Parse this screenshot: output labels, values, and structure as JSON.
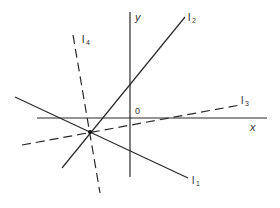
{
  "diagram": {
    "axes": {
      "x_label": "x",
      "y_label": "y",
      "origin_label": "0"
    },
    "lines": [
      {
        "id": "l1",
        "label": "l",
        "subscript": "1",
        "style": "solid"
      },
      {
        "id": "l2",
        "label": "l",
        "subscript": "2",
        "style": "solid"
      },
      {
        "id": "l3",
        "label": "l",
        "subscript": "3",
        "style": "dashed"
      },
      {
        "id": "l4",
        "label": "l",
        "subscript": "4",
        "style": "dashed"
      }
    ],
    "intersection_point": "common point of l1, l2, l3, l4",
    "colors": {
      "line": "#2a2a2a",
      "background": "#ffffff"
    }
  }
}
